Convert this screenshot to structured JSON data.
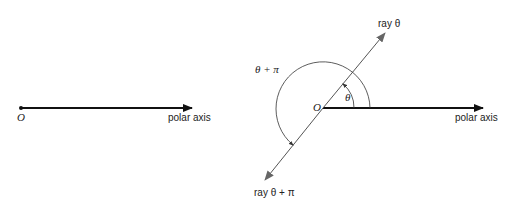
{
  "left_figure": {
    "origin_label": "O",
    "axis_label": "polar axis"
  },
  "right_figure": {
    "origin_label": "O",
    "axis_label": "polar axis",
    "ray_label": "ray θ",
    "opposite_ray_label": "ray θ + π",
    "angle_label": "θ",
    "opposite_angle_label": "θ + π"
  },
  "colors": {
    "line": "#111111",
    "ray": "#555555",
    "arrowhead": "#666666"
  }
}
